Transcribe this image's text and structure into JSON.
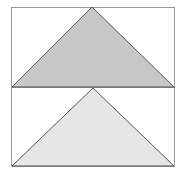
{
  "diagram": {
    "panels": [
      {
        "name": "top-panel",
        "fill": "#c8c8c8",
        "x": 11,
        "y": 7,
        "w": 164,
        "h": 80,
        "triangle": [
          [
            12,
            87
          ],
          [
            92,
            7
          ],
          [
            174,
            87
          ]
        ]
      },
      {
        "name": "bottom-panel",
        "fill": "#e6e6e6",
        "x": 11,
        "y": 87,
        "w": 164,
        "h": 80,
        "triangle": [
          [
            12,
            166
          ],
          [
            93,
            88
          ],
          [
            174,
            166
          ]
        ]
      }
    ],
    "stroke": "#555555",
    "frame_stroke": "#999999"
  }
}
